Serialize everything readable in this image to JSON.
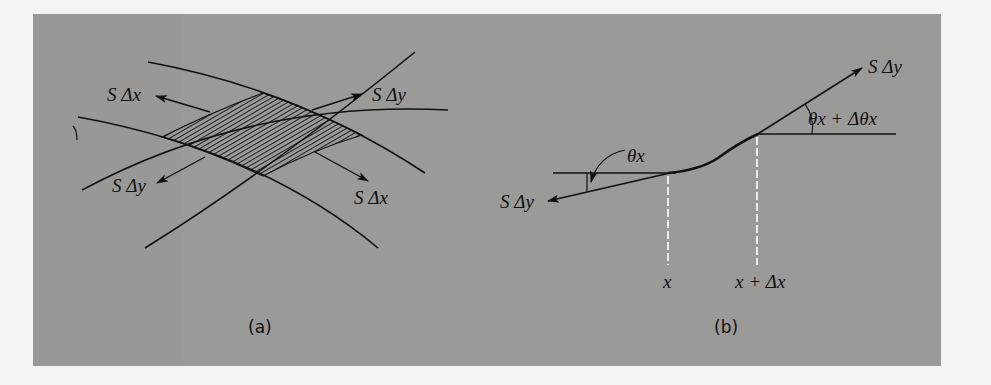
{
  "figure": {
    "background_color": "#9a9a98",
    "page_color": "#f4f4f2",
    "ink_color": "#111111",
    "dash_color": "#ffffff"
  },
  "panel_a": {
    "caption": "(a)",
    "labels": {
      "upper_left": "S Δx",
      "upper_right": "S Δy",
      "lower_left": "S Δy",
      "lower_right": "S Δx"
    },
    "description": "Hatched curvilinear element bounded by four curves, with tension vectors on each edge"
  },
  "panel_b": {
    "caption": "(b)",
    "labels": {
      "left_tension": "S Δy",
      "right_tension": "S Δy",
      "left_angle": "θx",
      "right_angle": "θx + Δθx",
      "left_position": "x",
      "right_position": "x + Δx"
    },
    "description": "Side view of membrane cross-section between x and x + Δx with tension forces at angles"
  }
}
